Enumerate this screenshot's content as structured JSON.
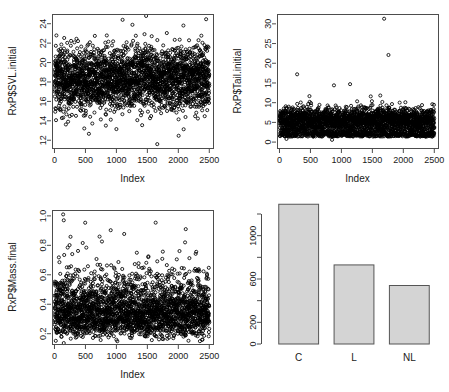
{
  "figure": {
    "layout": "2x2 grid of R base-graphics panels",
    "background": "#ffffff",
    "point_color": "#000000",
    "bar_fill": "#d4d4d4",
    "bar_border": "#555555",
    "axis_color": "#4d4d4d"
  },
  "chart_data": [
    {
      "type": "scatter",
      "panel": "top-left",
      "title": "",
      "xlabel": "Index",
      "ylabel": "RxP$SVL.initial",
      "xlim": [
        -40,
        2560
      ],
      "ylim": [
        11.2,
        25.0
      ],
      "xticks": [
        0,
        500,
        1000,
        1500,
        2000,
        2500
      ],
      "xticklabels": [
        "0",
        "500",
        "1000",
        "1500",
        "2000",
        "2500"
      ],
      "yticks": [
        12,
        14,
        16,
        18,
        20,
        22,
        24
      ],
      "yticklabels": [
        "12",
        "14",
        "16",
        "18",
        "20",
        "22",
        "24"
      ],
      "grid": false,
      "legend": null,
      "n_points": 2500,
      "marker": "open-circle",
      "distribution": {
        "x": "uniform index 1..2500",
        "y": "normal-like, mean about 18.3, sd about 1.6, range 11.5 to 24.8"
      },
      "notable_points": [
        {
          "x": 1660,
          "y": 11.6,
          "note": "low outlier"
        },
        {
          "x": 1480,
          "y": 24.8,
          "note": "high outlier"
        },
        {
          "x": 1100,
          "y": 24.4,
          "note": "high outlier"
        }
      ]
    },
    {
      "type": "scatter",
      "panel": "top-right",
      "title": "",
      "xlabel": "Index",
      "ylabel": "RxP$Tail.initial",
      "xlim": [
        -40,
        2560
      ],
      "ylim": [
        -1.5,
        32.5
      ],
      "xticks": [
        0,
        500,
        1000,
        1500,
        2000,
        2500
      ],
      "xticklabels": [
        "0",
        "500",
        "1000",
        "1500",
        "2000",
        "2500"
      ],
      "yticks": [
        0,
        5,
        10,
        15,
        20,
        25,
        30
      ],
      "yticklabels": [
        "0",
        "5",
        "10",
        "15",
        "20",
        "25",
        "30"
      ],
      "grid": false,
      "legend": null,
      "n_points": 2500,
      "marker": "open-circle",
      "distribution": {
        "x": "uniform index 1..2500",
        "y": "bimodal dense band 0 to 10, main mass about 4 to 8, secondary mass about 0 to 3"
      },
      "notable_points": [
        {
          "x": 1690,
          "y": 31.3,
          "note": "extreme high outlier"
        },
        {
          "x": 1760,
          "y": 22.1,
          "note": "high outlier"
        },
        {
          "x": 285,
          "y": 17.2,
          "note": "high outlier"
        },
        {
          "x": 880,
          "y": 14.4,
          "note": "high outlier"
        },
        {
          "x": 1140,
          "y": 14.7,
          "note": "high outlier"
        }
      ]
    },
    {
      "type": "scatter",
      "panel": "bottom-left",
      "title": "",
      "xlabel": "Index",
      "ylabel": "RxP$Mass.final",
      "xlim": [
        -40,
        2560
      ],
      "ylim": [
        0.13,
        1.04
      ],
      "xticks": [
        0,
        500,
        1000,
        1500,
        2000,
        2500
      ],
      "xticklabels": [
        "0",
        "500",
        "1000",
        "1500",
        "2000",
        "2500"
      ],
      "yticks": [
        0.2,
        0.4,
        0.6,
        0.8,
        1.0
      ],
      "yticklabels": [
        "0.2",
        "0.4",
        "0.6",
        "0.8",
        "1.0"
      ],
      "grid": false,
      "legend": null,
      "n_points": 2500,
      "marker": "open-circle",
      "distribution": {
        "x": "uniform index 1..2500",
        "y": "right-skewed, dense band about 0.25 to 0.45, tail up to 1.0"
      },
      "notable_points": [
        {
          "x": 140,
          "y": 1.01,
          "note": "high outlier"
        },
        {
          "x": 150,
          "y": 0.97,
          "note": "high outlier"
        },
        {
          "x": 2120,
          "y": 0.91,
          "note": "high outlier"
        },
        {
          "x": 2390,
          "y": 0.16,
          "note": "low outlier"
        }
      ]
    },
    {
      "type": "bar",
      "panel": "bottom-right",
      "title": "",
      "xlabel": "",
      "ylabel": "",
      "categories": [
        "C",
        "L",
        "NL"
      ],
      "values": [
        1290,
        730,
        540
      ],
      "ylim": [
        0,
        1290
      ],
      "yticks": [
        0,
        200,
        400,
        600,
        800,
        1000,
        1200
      ],
      "yticklabels": [
        "0",
        "200",
        "",
        "600",
        "",
        "1000",
        ""
      ],
      "labeled_yticks": [
        0,
        200,
        600,
        1000
      ],
      "grid": false,
      "legend": null
    }
  ]
}
